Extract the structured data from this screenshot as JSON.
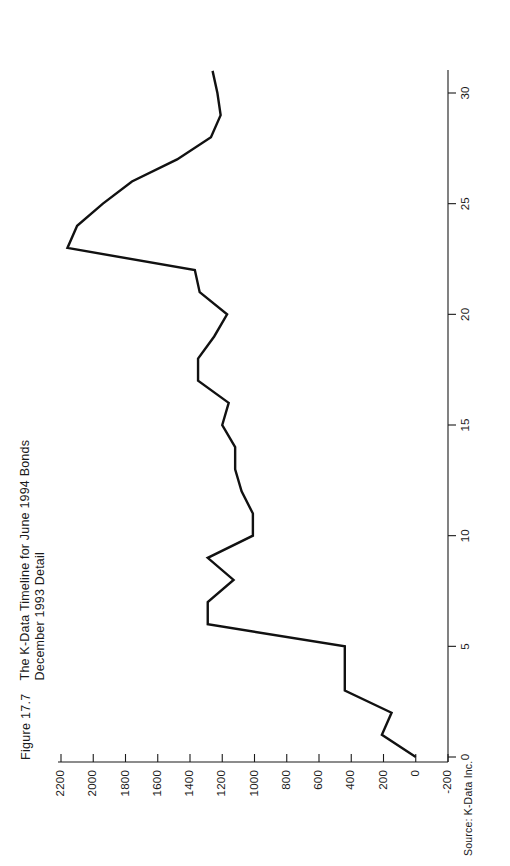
{
  "figure": {
    "number": "Figure 17.7",
    "title_line_1": "The K-Data Timeline for June 1994 Bonds",
    "title_line_2": "December 1993 Detail",
    "source": "Source: K-Data Inc."
  },
  "colors": {
    "line": "#111111",
    "axis": "#1a1a1a",
    "background": "#ffffff"
  },
  "chart_data": {
    "type": "line",
    "orientation": "rotated-90",
    "xlabel": "",
    "ylabel": "",
    "grid": false,
    "legend": "none",
    "source": "Source: K-Data Inc.",
    "x": [
      0,
      1,
      2,
      3,
      4,
      5,
      6,
      7,
      8,
      9,
      10,
      11,
      12,
      13,
      14,
      15,
      16,
      17,
      18,
      19,
      20,
      21,
      22,
      23,
      24,
      25,
      26,
      27,
      28,
      29,
      30,
      31
    ],
    "xlim": [
      0,
      31
    ],
    "xticks": [
      0,
      5,
      10,
      15,
      20,
      25,
      30
    ],
    "xtick_labels": [
      "0",
      "5",
      "10",
      "15",
      "20",
      "25",
      "30"
    ],
    "ylim": [
      -200,
      2200
    ],
    "yticks": [
      -200,
      0,
      200,
      400,
      600,
      800,
      1000,
      1200,
      1400,
      1600,
      1800,
      2000,
      2200
    ],
    "ytick_labels": [
      "-200",
      "0",
      "200",
      "400",
      "600",
      "800",
      "1000",
      "1200",
      "1400",
      "1600",
      "1800",
      "2000",
      "2200"
    ],
    "series": [
      {
        "name": "K-Data Timeline",
        "values": [
          0,
          210,
          150,
          440,
          440,
          440,
          1290,
          1290,
          1130,
          1290,
          1010,
          1010,
          1080,
          1120,
          1120,
          1200,
          1160,
          1350,
          1350,
          1250,
          1170,
          1340,
          1370,
          2160,
          2100,
          1940,
          1760,
          1480,
          1270,
          1210,
          1230,
          1260
        ]
      }
    ]
  }
}
